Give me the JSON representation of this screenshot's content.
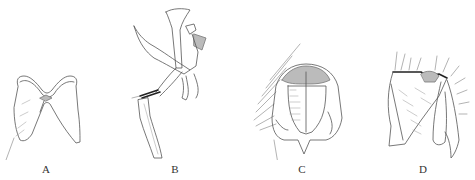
{
  "figure": {
    "panels": [
      {
        "id": "A",
        "label": "A",
        "subject": "genitalic structure, ventral view"
      },
      {
        "id": "B",
        "label": "B",
        "subject": "genitalic structure, lateral view"
      },
      {
        "id": "C",
        "label": "C",
        "subject": "terminalia, posterior view"
      },
      {
        "id": "D",
        "label": "D",
        "subject": "terminalia, lateral view"
      }
    ]
  }
}
